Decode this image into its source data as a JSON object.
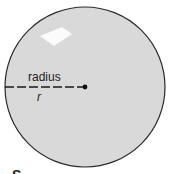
{
  "diagram": {
    "radius_label": "radius",
    "radius_symbol": "r",
    "caption_partial": "S",
    "colors": {
      "fill": "#d8d8d8",
      "stroke": "#333333",
      "highlight": "#ffffff",
      "background": "#ffffff"
    }
  }
}
